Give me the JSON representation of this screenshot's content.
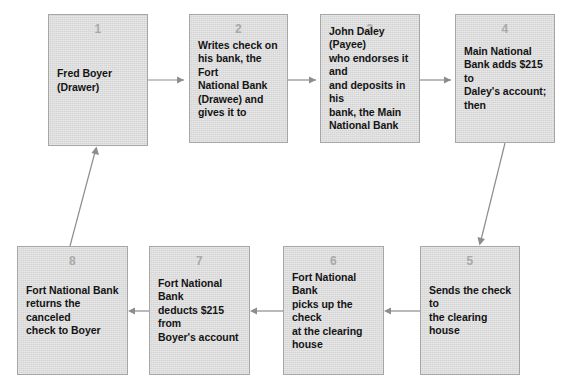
{
  "diagram": {
    "palette": {
      "node_fill": "#d4d4d4",
      "node_border": "#a6a6a6",
      "number_color": "#a9a9a9",
      "text_color": "#141414",
      "arrow_color": "#8d8d8d",
      "background": "#ffffff"
    },
    "nodes": [
      {
        "id": "node-1",
        "number": "1",
        "text": "Fred Boyer\n(Drawer)",
        "x": 48,
        "y": 14,
        "w": 100,
        "h": 132
      },
      {
        "id": "node-2",
        "number": "2",
        "text": "Writes check on\nhis bank, the Fort\nNational Bank\n(Drawee) and\ngives it to",
        "x": 189,
        "y": 14,
        "w": 99,
        "h": 129
      },
      {
        "id": "node-3",
        "number": "3",
        "text": "John Daley (Payee)\nwho endorses it and\nand deposits in his\nbank, the Main\nNational Bank",
        "x": 320,
        "y": 14,
        "w": 100,
        "h": 129
      },
      {
        "id": "node-4",
        "number": "4",
        "text": "Main National\nBank adds $215 to\nDaley's account;\nthen",
        "x": 455,
        "y": 14,
        "w": 100,
        "h": 129
      },
      {
        "id": "node-5",
        "number": "5",
        "text": "Sends the check to\nthe clearing house",
        "x": 420,
        "y": 246,
        "w": 100,
        "h": 129
      },
      {
        "id": "node-6",
        "number": "6",
        "text": "Fort National Bank\npicks up the check\nat the clearing\nhouse",
        "x": 283,
        "y": 246,
        "w": 101,
        "h": 129
      },
      {
        "id": "node-7",
        "number": "7",
        "text": "Fort National Bank\ndeducts $215 from\nBoyer's account",
        "x": 149,
        "y": 246,
        "w": 101,
        "h": 129
      },
      {
        "id": "node-8",
        "number": "8",
        "text": "Fort National Bank\nreturns the canceled\ncheck to Boyer",
        "x": 17,
        "y": 246,
        "w": 111,
        "h": 129
      }
    ],
    "connectors": [
      {
        "id": "arrow-1-to-2",
        "from": "node-1",
        "to": "node-2",
        "direction": "right",
        "path": "M148,80 L184,80",
        "head": "M184,80 L177,76.5 L177,83.5 Z"
      },
      {
        "id": "arrow-2-to-3",
        "from": "node-2",
        "to": "node-3",
        "direction": "right",
        "path": "M288,80 L316,80",
        "head": "M316,80 L309,76.5 L309,83.5 Z"
      },
      {
        "id": "arrow-3-to-4",
        "from": "node-3",
        "to": "node-4",
        "direction": "right",
        "path": "M420,80 L451,80",
        "head": "M451,80 L444,76.5 L444,83.5 Z"
      },
      {
        "id": "arrow-4-to-5",
        "from": "node-4",
        "to": "node-5",
        "direction": "diagonal-down-left",
        "path": "M505,143 L481,240",
        "head": "M479.5,245.5 L477.5,237 L485,239 Z"
      },
      {
        "id": "arrow-5-to-6",
        "from": "node-5",
        "to": "node-6",
        "direction": "left",
        "path": "M420,311 L389,311",
        "head": "M384,311 L391,307.5 L391,314.5 Z"
      },
      {
        "id": "arrow-6-to-7",
        "from": "node-6",
        "to": "node-7",
        "direction": "left",
        "path": "M283,311 L255,311",
        "head": "M250,311 L257,307.5 L257,314.5 Z"
      },
      {
        "id": "arrow-7-to-8",
        "from": "node-7",
        "to": "node-8",
        "direction": "left",
        "path": "M149,311 L133,311",
        "head": "M128,311 L135,307.5 L135,314.5 Z"
      },
      {
        "id": "arrow-8-to-1",
        "from": "node-8",
        "to": "node-1",
        "direction": "diagonal-up-right",
        "path": "M70,246 L95,152",
        "head": "M96.5,146.5 L99,155 L91.5,153 Z"
      }
    ],
    "caption": ""
  }
}
